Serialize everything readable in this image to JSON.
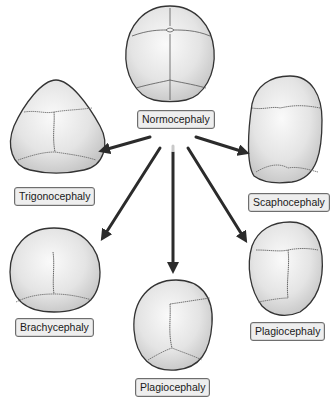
{
  "diagram": {
    "center": {
      "label": "Normocephaly"
    },
    "variants": [
      {
        "id": "trigonocephaly",
        "label": "Trigonocephaly",
        "position": "upper-left"
      },
      {
        "id": "scaphocephaly",
        "label": "Scaphocephaly",
        "position": "upper-right"
      },
      {
        "id": "brachycephaly",
        "label": "Brachycephaly",
        "position": "lower-left"
      },
      {
        "id": "plagiocephaly-bottom",
        "label": "Plagiocephaly",
        "position": "bottom-center"
      },
      {
        "id": "plagiocephaly-right",
        "label": "Plagiocephaly",
        "position": "lower-right"
      }
    ],
    "colors": {
      "skull_fill": "#e6e6e6",
      "skull_outline": "#333333",
      "suture": "#555555",
      "arrow": "#2b2b2b",
      "label_bg": "#eeeeee",
      "label_border": "#6e6e6e"
    }
  }
}
